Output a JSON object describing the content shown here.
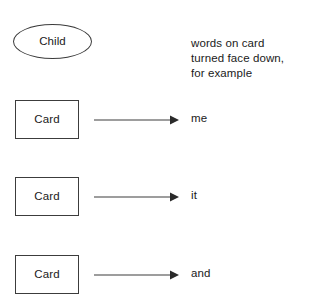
{
  "diagram": {
    "type": "flow-diagram",
    "child_node": {
      "shape": "ellipse",
      "label": "Child"
    },
    "annotation": {
      "lines": [
        "words on card",
        "turned face down,",
        "for example"
      ]
    },
    "rows": [
      {
        "card_label": "Card",
        "arrow": "arrow-right",
        "word": "me"
      },
      {
        "card_label": "Card",
        "arrow": "arrow-right",
        "word": "it"
      },
      {
        "card_label": "Card",
        "arrow": "arrow-right",
        "word": "and"
      }
    ],
    "colors": {
      "stroke": "#3c3c3c",
      "text": "#1a1a1a",
      "background": "#ffffff"
    }
  }
}
